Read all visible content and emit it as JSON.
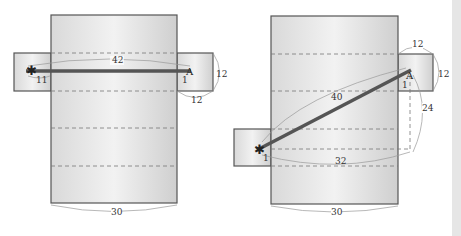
{
  "diagrams": [
    {
      "name": "unfolded-net-wrap-over",
      "labels": {
        "path_length": "42",
        "left_offset": "11",
        "right_offset": "1",
        "side_height": "12",
        "side_width": "12",
        "bottom_width": "30"
      }
    },
    {
      "name": "unfolded-net-diagonal",
      "labels": {
        "path_length": "40",
        "horizontal": "32",
        "vertical": "24",
        "top_width": "12",
        "side_height": "12",
        "left_offset": "1",
        "right_offset": "1",
        "bottom_width": "30"
      }
    }
  ],
  "colors": {
    "panel_fill": "#e2e2e2",
    "outline": "#555555",
    "path": "#555555",
    "scrollbar": "#e6e6e6"
  }
}
